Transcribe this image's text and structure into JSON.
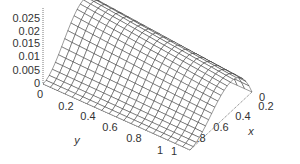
{
  "chart_data": {
    "type": "surface3d",
    "title": "",
    "xlabel": "x",
    "ylabel": "y",
    "zlabel": "",
    "xlim": [
      0,
      1
    ],
    "ylim": [
      0,
      1
    ],
    "zlim": [
      0,
      0.025
    ],
    "x_ticks": [
      "0",
      "0.2",
      "0.4",
      "0.6",
      "0.8",
      "1"
    ],
    "y_ticks": [
      "0",
      "0.2",
      "0.4",
      "0.6",
      "0.8",
      "1"
    ],
    "z_ticks": [
      "0",
      "0.005",
      "0.01",
      "0.015",
      "0.02",
      "0.025"
    ],
    "grid_resolution": 20,
    "surface_description": "Wireframe surface vanishing on x=0 and x=1, rising to a maximum ridge of about 0.025 near small-to-mid x at y near 0, decreasing toward y=1",
    "sample_values": {
      "x": [
        0,
        0.25,
        0.5,
        0.75,
        1
      ],
      "y0_z": [
        0,
        0.02,
        0.025,
        0.015,
        0
      ],
      "y1_z": [
        0,
        0.0,
        0.0,
        0.0,
        0
      ]
    },
    "grid": false,
    "legend": "none"
  },
  "axes": {
    "z_tick_labels": [
      "0.025",
      "0.02",
      "0.015",
      "0.01",
      "0.005",
      "0"
    ],
    "y_tick_labels": [
      "0",
      "0.2",
      "0.4",
      "0.6",
      "0.8",
      "1"
    ],
    "x_tick_labels": [
      "0",
      "0.2",
      "0.4",
      "0.6",
      "0.8",
      "1"
    ],
    "x_name": "x",
    "y_name": "y"
  },
  "colors": {
    "mesh": "#222222",
    "axis": "#555555",
    "background": "#ffffff"
  }
}
